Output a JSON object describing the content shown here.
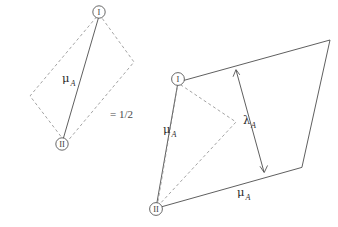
{
  "figure": {
    "title": "",
    "background_color": "#ffffff",
    "line_color": "#4d4d4d",
    "dashed_color": "#8c8c8c",
    "text_color": "#2b2b2b"
  },
  "relation": {
    "symbol": "= 1/2"
  },
  "left_shape": {
    "name": "dashed-parallelogram-with-diagonal",
    "marker_top": "I",
    "marker_bottom": "II",
    "edge_label": "μ",
    "edge_label_sub": "A"
  },
  "right_shape": {
    "name": "large-parallelogram-with-inner-triangle",
    "marker_top": "I",
    "marker_bottom": "II",
    "left_edge_label": "μ",
    "left_edge_label_sub": "A",
    "bottom_edge_label": "μ",
    "bottom_edge_label_sub": "A",
    "inner_arrow_label": "λ",
    "inner_arrow_label_sub": "A"
  }
}
